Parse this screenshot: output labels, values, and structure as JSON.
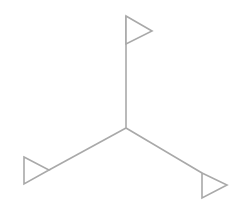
{
  "diagram": {
    "type": "three-armed-junction-with-flags",
    "colors": {
      "background": "#ffffff",
      "stroke": "#a9a9a9",
      "flag_fill": "#ffffff"
    },
    "center": {
      "x": 126,
      "y": 128
    },
    "arms": [
      {
        "name": "top",
        "end": {
          "x": 126,
          "y": 16
        },
        "flag": [
          [
            126,
            16
          ],
          [
            152,
            31
          ],
          [
            126,
            44
          ]
        ]
      },
      {
        "name": "bottom-left",
        "end": {
          "x": 49,
          "y": 170
        },
        "flag": [
          [
            24,
            157
          ],
          [
            49,
            170
          ],
          [
            24,
            184
          ]
        ]
      },
      {
        "name": "bottom-right",
        "end": {
          "x": 202,
          "y": 173
        },
        "flag": [
          [
            202,
            173
          ],
          [
            227,
            185
          ],
          [
            202,
            198
          ]
        ]
      }
    ]
  }
}
